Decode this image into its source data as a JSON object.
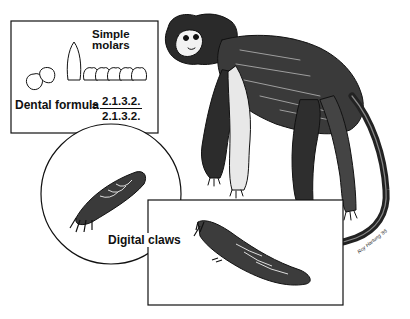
{
  "figure": {
    "panels": {
      "dentition": {
        "label_molars_line1": "Simple",
        "label_molars_line2": "molars",
        "formula_label": "Dental formula",
        "formula_equals": "=",
        "formula_upper": "2.1.3.2.",
        "formula_lower": "2.1.3.2."
      },
      "hand": {
        "label": "Digital claws"
      }
    },
    "signature": "Roy Hartung '85",
    "colors": {
      "ink": "#111111",
      "background": "#ffffff"
    }
  }
}
